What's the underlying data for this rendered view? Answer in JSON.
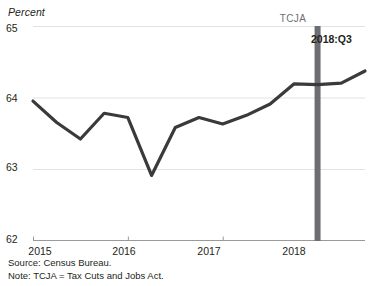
{
  "chart_data": {
    "type": "line",
    "title": "",
    "subtitle": "",
    "unit_label": "Percent",
    "xlabel": "",
    "ylabel": "Percent",
    "ylim": [
      62,
      65
    ],
    "yticks": [
      62,
      63,
      64,
      65
    ],
    "ytick_labels": [
      "62",
      "63",
      "64",
      "65"
    ],
    "xtick_labels": [
      "2015",
      "2016",
      "2017",
      "2018"
    ],
    "xticks": [
      2015,
      2016,
      2017,
      2018
    ],
    "grid": "horizontal",
    "legend": "none",
    "line_color": "#3a3a3a",
    "x": [
      "2015:Q1",
      "2015:Q2",
      "2015:Q3",
      "2015:Q4",
      "2016:Q1",
      "2016:Q2",
      "2016:Q3",
      "2016:Q4",
      "2017:Q1",
      "2017:Q2",
      "2017:Q3",
      "2017:Q4",
      "2018:Q1",
      "2018:Q2",
      "2018:Q3"
    ],
    "values": [
      63.95,
      63.65,
      63.42,
      63.78,
      63.72,
      62.91,
      63.58,
      63.72,
      63.63,
      63.75,
      63.91,
      64.19,
      64.18,
      64.2,
      64.37
    ],
    "annotations": [
      {
        "name": "tcja-marker",
        "label": "TCJA",
        "x": "2018:Q1",
        "type": "vline",
        "color": "#6d6e71"
      },
      {
        "name": "endpoint-callout",
        "label": "2018:Q3",
        "x": "2018:Q3",
        "type": "text"
      }
    ]
  },
  "footnotes": {
    "source": "Source: Census Bureau.",
    "note": "Note: TCJA = Tax Cuts and Jobs Act."
  }
}
